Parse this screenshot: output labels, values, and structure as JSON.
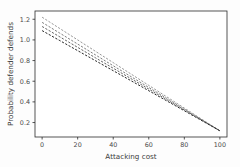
{
  "figure": {
    "background_color": "#fdfdfd",
    "plot_background_color": "#ffffff",
    "spine_color": "#2b2b2b",
    "text_color": "#3c3c3c"
  },
  "chart_data": {
    "type": "line",
    "title": "",
    "xlabel": "Attacking cost",
    "ylabel": "Probability defender defends",
    "xlim": [
      -4,
      104
    ],
    "ylim": [
      0.06,
      1.28
    ],
    "xticks": [
      0,
      20,
      40,
      60,
      80,
      100
    ],
    "xticklabels": [
      "0",
      "20",
      "40",
      "60",
      "80",
      "100"
    ],
    "yticks": [
      0.2,
      0.4,
      0.6,
      0.8,
      1.0,
      1.2
    ],
    "yticklabels": [
      "0.2",
      "0.4",
      "0.6",
      "0.8",
      "1.0",
      "1.2"
    ],
    "grid": false,
    "legend": null,
    "legend_position": "none",
    "x": [
      0,
      10,
      20,
      30,
      40,
      50,
      60,
      70,
      80,
      90,
      100
    ],
    "series": [
      {
        "name": "line-1",
        "linestyle": "dashed",
        "color": "#8c8c8c",
        "linewidth": 0.9,
        "values": [
          1.22,
          1.11,
          1.0,
          0.89,
          0.78,
          0.67,
          0.56,
          0.45,
          0.34,
          0.23,
          0.12
        ]
      },
      {
        "name": "line-2",
        "linestyle": "dashed",
        "color": "#6e6e6e",
        "linewidth": 0.9,
        "values": [
          1.17,
          1.065,
          0.96,
          0.855,
          0.75,
          0.645,
          0.54,
          0.435,
          0.33,
          0.225,
          0.12
        ]
      },
      {
        "name": "line-3",
        "linestyle": "dashed",
        "color": "#4f4f4f",
        "linewidth": 0.9,
        "values": [
          1.13,
          1.029,
          0.928,
          0.827,
          0.726,
          0.625,
          0.524,
          0.423,
          0.322,
          0.221,
          0.12
        ]
      },
      {
        "name": "line-4",
        "linestyle": "dashed",
        "color": "#262626",
        "linewidth": 1.0,
        "values": [
          1.09,
          0.993,
          0.896,
          0.799,
          0.702,
          0.605,
          0.508,
          0.411,
          0.314,
          0.217,
          0.12
        ]
      }
    ]
  }
}
